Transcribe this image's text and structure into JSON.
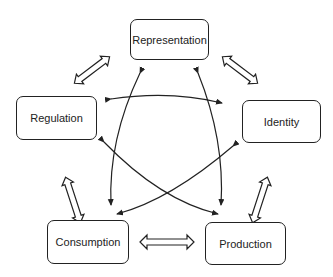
{
  "diagram": {
    "nodes": [
      {
        "id": "representation",
        "label": "Representation"
      },
      {
        "id": "identity",
        "label": "Identity"
      },
      {
        "id": "production",
        "label": "Production"
      },
      {
        "id": "consumption",
        "label": "Consumption"
      },
      {
        "id": "regulation",
        "label": "Regulation"
      }
    ],
    "edges": [
      {
        "from": "representation",
        "to": "identity",
        "style": "double-outline-arrow"
      },
      {
        "from": "identity",
        "to": "production",
        "style": "double-outline-arrow"
      },
      {
        "from": "production",
        "to": "consumption",
        "style": "double-outline-arrow"
      },
      {
        "from": "consumption",
        "to": "regulation",
        "style": "double-outline-arrow"
      },
      {
        "from": "regulation",
        "to": "representation",
        "style": "double-outline-arrow"
      },
      {
        "from": "regulation",
        "to": "identity",
        "style": "curved-bidirectional"
      },
      {
        "from": "representation",
        "to": "consumption",
        "style": "curved-bidirectional"
      },
      {
        "from": "representation",
        "to": "production",
        "style": "curved-bidirectional"
      },
      {
        "from": "regulation",
        "to": "production",
        "style": "curved-bidirectional"
      },
      {
        "from": "identity",
        "to": "consumption",
        "style": "curved-bidirectional"
      }
    ]
  }
}
